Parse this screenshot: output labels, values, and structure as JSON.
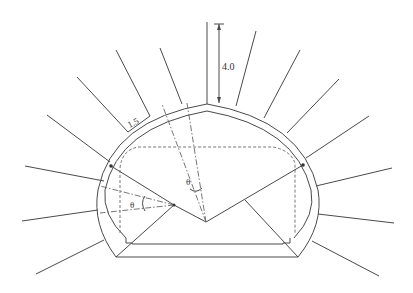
{
  "diagram": {
    "labels": {
      "bolt_length": "4.0",
      "bolt_spacing": "1.5",
      "angle_top": "θ",
      "angle_left": "θ"
    },
    "colors": {
      "line": "#4a4a4a",
      "background": "#ffffff"
    }
  }
}
